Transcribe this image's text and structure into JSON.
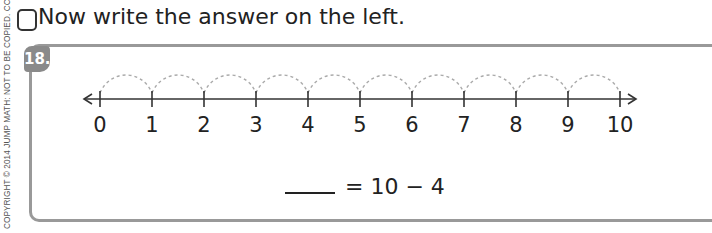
{
  "copyright": "COPYRIGHT © 2014 JUMP MATH: NOT TO BE COPIED. CC EDITION",
  "instruction": "Now write the answer on the left.",
  "problem": {
    "number": "18.",
    "number_line": {
      "start": 0,
      "end": 10,
      "labels": [
        "0",
        "1",
        "2",
        "3",
        "4",
        "5",
        "6",
        "7",
        "8",
        "9",
        "10"
      ],
      "hops": 10
    },
    "equation": {
      "blank": "",
      "text": "= 10 − 4"
    }
  }
}
